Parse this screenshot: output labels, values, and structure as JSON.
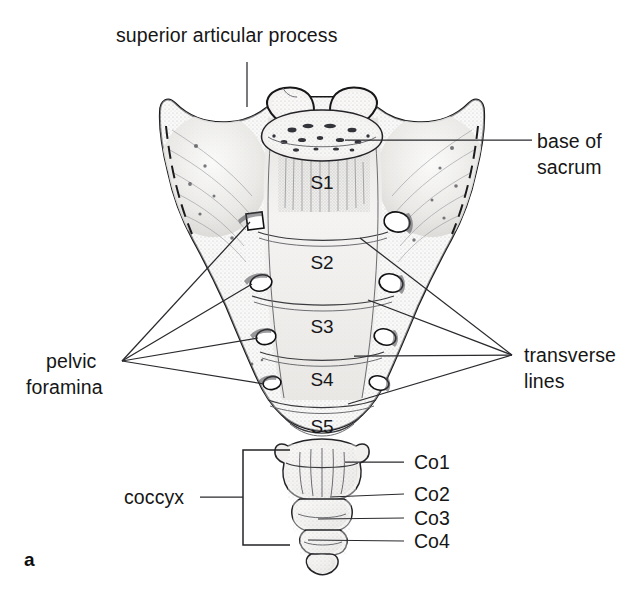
{
  "figure": {
    "label": "a",
    "background_color": "#ffffff",
    "ink_color": "#161616"
  },
  "callouts": {
    "superior_articular_process": {
      "text": "superior articular process",
      "position": "top-center",
      "leader": "vertical line down to left superior articular process"
    },
    "base_of_sacrum": {
      "line1": "base of",
      "line2": "sacrum",
      "position": "right-upper",
      "leader": "horizontal line to superior surface of S1 body"
    },
    "pelvic_foramina": {
      "line1": "pelvic",
      "line2": "foramina",
      "position": "left-middle",
      "leader": "fan of four lines to left anterior sacral foramina"
    },
    "transverse_lines": {
      "line1": "transverse",
      "line2": "lines",
      "position": "right-middle",
      "leader": "fan of four lines to transverse ridges between sacral bodies"
    },
    "coccyx": {
      "text": "coccyx",
      "position": "left-lower",
      "leader": "bracket enclosing the four coccygeal segments"
    }
  },
  "sacral_segments": [
    {
      "label": "S1",
      "cx": 322,
      "cy": 182
    },
    {
      "label": "S2",
      "cx": 322,
      "cy": 262
    },
    {
      "label": "S3",
      "cx": 322,
      "cy": 326
    },
    {
      "label": "S4",
      "cx": 322,
      "cy": 379
    },
    {
      "label": "S5",
      "cx": 322,
      "cy": 426
    }
  ],
  "coccygeal_segments": [
    {
      "label": "Co1",
      "text_x": 414,
      "text_y": 468,
      "leader_from_x": 345,
      "leader_from_y": 462
    },
    {
      "label": "Co2",
      "text_x": 414,
      "text_y": 500,
      "leader_from_x": 330,
      "leader_from_y": 497
    },
    {
      "label": "Co3",
      "text_x": 414,
      "text_y": 525,
      "leader_from_x": 318,
      "leader_from_y": 519
    },
    {
      "label": "Co4",
      "text_x": 414,
      "text_y": 548,
      "leader_from_x": 308,
      "leader_from_y": 540
    }
  ],
  "foramina": {
    "left": [
      {
        "cx": 253,
        "cy": 222
      },
      {
        "cx": 261,
        "cy": 283
      },
      {
        "cx": 266,
        "cy": 337
      },
      {
        "cx": 272,
        "cy": 383
      }
    ],
    "right": [
      {
        "cx": 397,
        "cy": 222
      },
      {
        "cx": 391,
        "cy": 283
      },
      {
        "cx": 385,
        "cy": 337
      },
      {
        "cx": 379,
        "cy": 383
      }
    ]
  },
  "fan_origins": {
    "pelvic_foramina": {
      "x": 122,
      "y": 361
    },
    "transverse_lines": {
      "x": 512,
      "y": 355
    }
  }
}
